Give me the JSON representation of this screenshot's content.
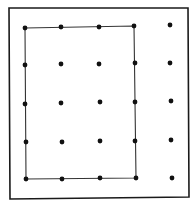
{
  "diagram": {
    "type": "geoboard",
    "width": 194,
    "height": 207,
    "border": {
      "x1": 9,
      "y1": 8,
      "x2": 188,
      "y2": 8,
      "x3": 189,
      "y3": 197,
      "x4": 10,
      "y4": 199,
      "color": "#1a1a1a",
      "stroke_width": 1.6
    },
    "grid": {
      "rows": 5,
      "cols": 5
    },
    "dots": [
      [
        [
          25,
          28
        ],
        [
          61,
          27
        ],
        [
          99,
          27
        ],
        [
          134,
          26
        ],
        [
          170,
          25
        ]
      ],
      [
        [
          25,
          65
        ],
        [
          61,
          64
        ],
        [
          99,
          64
        ],
        [
          135,
          63
        ],
        [
          170,
          63
        ]
      ],
      [
        [
          25,
          104
        ],
        [
          61,
          103
        ],
        [
          100,
          102
        ],
        [
          135,
          102
        ],
        [
          171,
          101
        ]
      ],
      [
        [
          26,
          142
        ],
        [
          62,
          142
        ],
        [
          100,
          141
        ],
        [
          135,
          141
        ],
        [
          171,
          140
        ]
      ],
      [
        [
          26,
          179
        ],
        [
          62,
          179
        ],
        [
          100,
          178
        ],
        [
          136,
          178
        ],
        [
          172,
          178
        ]
      ]
    ],
    "dot_radius": 2.4,
    "dot_color": "#111111",
    "rectangle": {
      "points": [
        [
          25,
          28
        ],
        [
          134,
          26
        ],
        [
          136,
          178
        ],
        [
          26,
          179
        ]
      ],
      "color": "#333333",
      "stroke_width": 1.1,
      "spans": "columns 1-4, rows 1-5"
    }
  }
}
